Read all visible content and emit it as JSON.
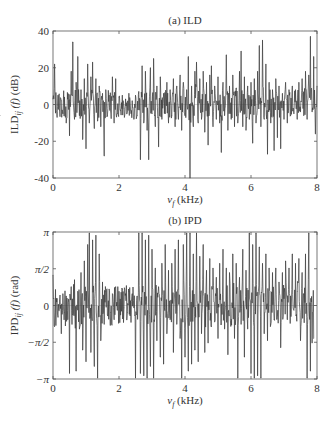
{
  "chart_data": [
    {
      "type": "line",
      "title": "(a) ILD",
      "xlabel": "v_f (kHz)",
      "ylabel": "ILD_ij (f) (dB)",
      "xlim": [
        0,
        8
      ],
      "ylim": [
        -40,
        40
      ],
      "xticks": [
        0,
        2,
        4,
        6,
        8
      ],
      "xtick_labels": [
        "0",
        "2",
        "4",
        "6",
        "8"
      ],
      "yticks": [
        -40,
        -20,
        0,
        20,
        40
      ],
      "ytick_labels": [
        "-40",
        "-20",
        "0",
        "20",
        "40"
      ],
      "grid": false,
      "x": [
        0,
        0.05,
        0.1,
        0.15,
        0.2,
        0.25,
        0.3,
        0.35,
        0.4,
        0.45,
        0.5,
        0.55,
        0.6,
        0.65,
        0.7,
        0.75,
        0.8,
        0.85,
        0.9,
        0.95,
        1.0,
        1.05,
        1.1,
        1.15,
        1.2,
        1.25,
        1.3,
        1.35,
        1.4,
        1.45,
        1.5,
        1.55,
        1.6,
        1.65,
        1.7,
        1.75,
        1.8,
        1.85,
        1.9,
        1.95,
        2.0,
        2.05,
        2.1,
        2.15,
        2.2,
        2.25,
        2.3,
        2.35,
        2.4,
        2.45,
        2.5,
        2.55,
        2.6,
        2.65,
        2.7,
        2.75,
        2.8,
        2.85,
        2.9,
        2.95,
        3.0,
        3.05,
        3.1,
        3.15,
        3.2,
        3.25,
        3.3,
        3.35,
        3.4,
        3.45,
        3.5,
        3.55,
        3.6,
        3.65,
        3.7,
        3.75,
        3.8,
        3.85,
        3.9,
        3.95,
        4.0,
        4.05,
        4.1,
        4.15,
        4.2,
        4.25,
        4.3,
        4.35,
        4.4,
        4.45,
        4.5,
        4.55,
        4.6,
        4.65,
        4.7,
        4.75,
        4.8,
        4.85,
        4.9,
        4.95,
        5.0,
        5.05,
        5.1,
        5.15,
        5.2,
        5.25,
        5.3,
        5.35,
        5.4,
        5.45,
        5.5,
        5.55,
        5.6,
        5.65,
        5.7,
        5.75,
        5.8,
        5.85,
        5.9,
        5.95,
        6.0,
        6.05,
        6.1,
        6.15,
        6.2,
        6.25,
        6.3,
        6.35,
        6.4,
        6.45,
        6.5,
        6.55,
        6.6,
        6.65,
        6.7,
        6.75,
        6.8,
        6.85,
        6.9,
        6.95,
        7.0,
        7.05,
        7.1,
        7.15,
        7.2,
        7.25,
        7.3,
        7.35,
        7.4,
        7.45,
        7.5,
        7.55,
        7.6,
        7.65,
        7.7,
        7.75,
        7.8,
        7.85,
        7.9,
        7.95,
        8.0
      ],
      "values": [
        3,
        22,
        -4,
        5,
        -3,
        2,
        -5,
        4,
        -10,
        3,
        -17,
        18,
        34,
        -8,
        12,
        26,
        -6,
        8,
        -19,
        14,
        -24,
        22,
        -10,
        15,
        23,
        -13,
        14,
        -9,
        10,
        -12,
        6,
        -28,
        8,
        -6,
        5,
        -4,
        15,
        -10,
        14,
        -5,
        4,
        -3,
        5,
        -2,
        3,
        -4,
        6,
        -3,
        2,
        -8,
        5,
        -6,
        7,
        -30,
        21,
        -10,
        18,
        -14,
        -30,
        20,
        -5,
        25,
        -12,
        10,
        -23,
        15,
        -8,
        6,
        -5,
        12,
        -10,
        8,
        -6,
        14,
        -12,
        10,
        -8,
        16,
        -14,
        12,
        -6,
        8,
        26,
        -40,
        10,
        -12,
        18,
        23,
        -10,
        14,
        -8,
        18,
        -15,
        12,
        -22,
        16,
        21,
        -12,
        10,
        -8,
        15,
        -10,
        -26,
        12,
        -6,
        27,
        -14,
        10,
        -8,
        16,
        -12,
        9,
        -10,
        18,
        29,
        -12,
        15,
        -14,
        10,
        -8,
        12,
        -21,
        14,
        -10,
        18,
        32,
        -12,
        35,
        -8,
        22,
        -27,
        12,
        -10,
        8,
        -25,
        14,
        -18,
        10,
        -24,
        6,
        -8,
        12,
        -10,
        8,
        -6,
        10,
        -5,
        8,
        -8,
        12,
        -4,
        14,
        -6,
        18,
        -8,
        16,
        37,
        -4,
        26,
        -16,
        10,
        -6
      ]
    },
    {
      "type": "line",
      "title": "(b) IPD",
      "xlabel": "v_f (kHz)",
      "ylabel": "IPD_ij (f) (rad)",
      "xlim": [
        0,
        8
      ],
      "ylim": [
        -3.1416,
        3.1416
      ],
      "xticks": [
        0,
        2,
        4,
        6,
        8
      ],
      "xtick_labels": [
        "0",
        "2",
        "4",
        "6",
        "8"
      ],
      "yticks": [
        -3.1416,
        -1.5708,
        0,
        1.5708,
        3.1416
      ],
      "ytick_labels": [
        "−π",
        "−π/2",
        "0",
        "π/2",
        "π"
      ],
      "grid": false,
      "x": [
        0,
        0.05,
        0.1,
        0.15,
        0.2,
        0.25,
        0.3,
        0.35,
        0.4,
        0.45,
        0.5,
        0.55,
        0.6,
        0.65,
        0.7,
        0.75,
        0.8,
        0.85,
        0.9,
        0.95,
        1.0,
        1.05,
        1.1,
        1.15,
        1.2,
        1.25,
        1.3,
        1.35,
        1.4,
        1.45,
        1.5,
        1.55,
        1.6,
        1.65,
        1.7,
        1.75,
        1.8,
        1.85,
        1.9,
        1.95,
        2.0,
        2.05,
        2.1,
        2.15,
        2.2,
        2.25,
        2.3,
        2.35,
        2.4,
        2.45,
        2.5,
        2.55,
        2.6,
        2.65,
        2.7,
        2.75,
        2.8,
        2.85,
        2.9,
        2.95,
        3.0,
        3.05,
        3.1,
        3.15,
        3.2,
        3.25,
        3.3,
        3.35,
        3.4,
        3.45,
        3.5,
        3.55,
        3.6,
        3.65,
        3.7,
        3.75,
        3.8,
        3.85,
        3.9,
        3.95,
        4.0,
        4.05,
        4.1,
        4.15,
        4.2,
        4.25,
        4.3,
        4.35,
        4.4,
        4.45,
        4.5,
        4.55,
        4.6,
        4.65,
        4.7,
        4.75,
        4.8,
        4.85,
        4.9,
        4.95,
        5.0,
        5.05,
        5.1,
        5.15,
        5.2,
        5.25,
        5.3,
        5.35,
        5.4,
        5.45,
        5.5,
        5.55,
        5.6,
        5.65,
        5.7,
        5.75,
        5.8,
        5.85,
        5.9,
        5.95,
        6.0,
        6.05,
        6.1,
        6.15,
        6.2,
        6.25,
        6.3,
        6.35,
        6.4,
        6.45,
        6.5,
        6.55,
        6.6,
        6.65,
        6.7,
        6.75,
        6.8,
        6.85,
        6.9,
        6.95,
        7.0,
        7.05,
        7.1,
        7.15,
        7.2,
        7.25,
        7.3,
        7.35,
        7.4,
        7.45,
        7.5,
        7.55,
        7.6,
        7.65,
        7.7,
        7.75,
        7.8,
        7.85,
        7.9,
        7.95,
        8.0
      ],
      "values": [
        1.3,
        -0.9,
        0.3,
        -0.5,
        0.2,
        -1.2,
        0.5,
        -0.3,
        0.4,
        -0.6,
        -2.9,
        0.8,
        -0.4,
        1.1,
        -2.8,
        0.6,
        -1.0,
        1.4,
        -1.9,
        1.9,
        -2.4,
        2.6,
        3.1,
        -2.0,
        2.8,
        -2.6,
        3.0,
        -3.1,
        2.2,
        -1.5,
        1.0,
        -0.8,
        0.6,
        -0.4,
        0.7,
        -0.3,
        0.5,
        -0.6,
        0.8,
        -0.2,
        0.6,
        -0.4,
        0.7,
        -0.1,
        0.5,
        -0.3,
        0.6,
        0.2,
        0.5,
        -0.1,
        -3.1,
        0.4,
        3.1,
        -2.9,
        3.1,
        -3.0,
        2.8,
        -3.1,
        3.0,
        -2.6,
        2.4,
        -3.1,
        1.6,
        -1.5,
        0.8,
        -2.2,
        1.8,
        -2.5,
        2.6,
        -1.2,
        1.5,
        -0.6,
        1.8,
        -2.0,
        2.4,
        -0.8,
        2.8,
        -1.4,
        -3.1,
        2.6,
        -2.2,
        3.1,
        -2.8,
        3.1,
        -2.5,
        2.2,
        -1.9,
        3.1,
        -2.4,
        2.1,
        -1.2,
        2.6,
        -2.0,
        1.5,
        -1.6,
        2.0,
        -0.9,
        1.6,
        -0.7,
        1.2,
        -1.4,
        1.8,
        -0.8,
        2.4,
        -1.0,
        1.6,
        -2.1,
        1.4,
        -0.6,
        2.2,
        -1.4,
        1.8,
        -3.1,
        1.2,
        -0.8,
        2.4,
        -2.2,
        1.5,
        -1.0,
        3.1,
        -2.9,
        2.6,
        -3.1,
        3.1,
        -3.0,
        2.5,
        -3.1,
        1.8,
        -1.2,
        2.2,
        -1.5,
        1.6,
        -0.8,
        1.4,
        -0.6,
        1.6,
        -0.4,
        1.0,
        -1.8,
        1.4,
        0.3,
        1.9,
        -0.6,
        1.6,
        0.4,
        2.2,
        -0.2,
        1.8,
        0.6,
        2.0,
        -1.5,
        1.4,
        0.5,
        2.2,
        -3.1,
        3.1,
        -2.8,
        -1.6,
        -1.4
      ]
    }
  ]
}
